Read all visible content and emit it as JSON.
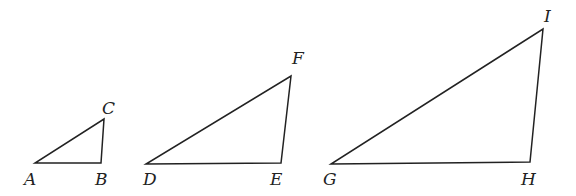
{
  "diagram": {
    "triangles": [
      {
        "name": "ABC",
        "vertices": [
          {
            "label": "A",
            "x": 35,
            "y": 163,
            "lx": 24,
            "ly": 185
          },
          {
            "label": "B",
            "x": 101,
            "y": 163,
            "lx": 95,
            "ly": 185
          },
          {
            "label": "C",
            "x": 104,
            "y": 119,
            "lx": 102,
            "ly": 114
          }
        ]
      },
      {
        "name": "DEF",
        "vertices": [
          {
            "label": "D",
            "x": 146,
            "y": 164,
            "lx": 143,
            "ly": 185
          },
          {
            "label": "E",
            "x": 281,
            "y": 163,
            "lx": 270,
            "ly": 185
          },
          {
            "label": "F",
            "x": 291,
            "y": 76,
            "lx": 292,
            "ly": 64
          }
        ]
      },
      {
        "name": "GHI",
        "vertices": [
          {
            "label": "G",
            "x": 331,
            "y": 164,
            "lx": 323,
            "ly": 185
          },
          {
            "label": "H",
            "x": 530,
            "y": 162,
            "lx": 521,
            "ly": 185
          },
          {
            "label": "I",
            "x": 543,
            "y": 29,
            "lx": 544,
            "ly": 22
          }
        ]
      }
    ]
  }
}
